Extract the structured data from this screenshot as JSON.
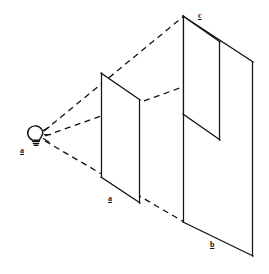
{
  "figure": {
    "kind": "perspective-projection-diagram",
    "background_color": "#ffffff",
    "line_color": "#111111",
    "canvas": {
      "width": 269,
      "height": 274
    }
  },
  "labels": {
    "source": "a",
    "panel_near": "a",
    "panel_far_bottom": "b",
    "panel_far_top": "c"
  },
  "light_source": {
    "icon_name": "light-bulb-icon",
    "label": "a",
    "position": {
      "x": 38,
      "y": 136
    },
    "ray_count": 3
  },
  "rays": [
    {
      "name": "upper-ray",
      "from": {
        "x": 44,
        "y": 132
      },
      "to": {
        "x": 184,
        "y": 16
      },
      "style": "dashed"
    },
    {
      "name": "middle-ray",
      "from": {
        "x": 44,
        "y": 136
      },
      "to": {
        "x": 253,
        "y": 62
      },
      "style": "dashed"
    },
    {
      "name": "lower-ray",
      "from": {
        "x": 44,
        "y": 141
      },
      "to": {
        "x": 183,
        "y": 222
      },
      "style": "dashed"
    }
  ],
  "panels": [
    {
      "name": "panel-a",
      "label": "a",
      "shape": "quadrilateral",
      "vertices": [
        {
          "x": 101,
          "y": 73
        },
        {
          "x": 140,
          "y": 100
        },
        {
          "x": 140,
          "y": 203
        },
        {
          "x": 101,
          "y": 177
        }
      ]
    },
    {
      "name": "panel-b",
      "label": "b",
      "shape": "quadrilateral",
      "vertices": [
        {
          "x": 183,
          "y": 16
        },
        {
          "x": 253,
          "y": 62
        },
        {
          "x": 253,
          "y": 256
        },
        {
          "x": 183,
          "y": 222
        }
      ]
    },
    {
      "name": "panel-c",
      "label": "c",
      "shape": "notched-quadrilateral",
      "vertices": [
        {
          "x": 183,
          "y": 16
        },
        {
          "x": 220,
          "y": 42
        },
        {
          "x": 220,
          "y": 140
        },
        {
          "x": 183,
          "y": 114
        }
      ]
    }
  ]
}
